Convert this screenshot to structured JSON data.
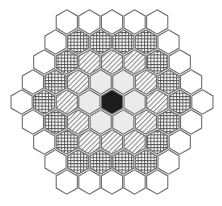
{
  "diagram": {
    "type": "hexagonal-lattice",
    "orientation": "pointy-top",
    "center": {
      "x": 112,
      "y": 102
    },
    "hex_radius": 12.2,
    "col_spacing": 22.6,
    "row_spacing": 20,
    "legend_styles": {
      "W": {
        "name": "white",
        "fill": "#ffffff"
      },
      "C": {
        "name": "crosshatch",
        "fill": "url(#crosshatch)"
      },
      "H": {
        "name": "diagonal-hatch",
        "fill": "url(#diaghatch)"
      },
      "G": {
        "name": "light-gray",
        "fill": "#ebebeb"
      },
      "B": {
        "name": "black",
        "fill": "#1c1c1c"
      }
    },
    "rows": [
      [
        "W",
        "W",
        "W",
        "W",
        "W"
      ],
      [
        "W",
        "C",
        "C",
        "C",
        "C",
        "W"
      ],
      [
        "W",
        "C",
        "H",
        "H",
        "H",
        "C",
        "W"
      ],
      [
        "W",
        "C",
        "H",
        "G",
        "G",
        "H",
        "C",
        "W"
      ],
      [
        "W",
        "C",
        "H",
        "G",
        "B",
        "G",
        "H",
        "C",
        "W"
      ],
      [
        "W",
        "C",
        "H",
        "G",
        "G",
        "H",
        "C",
        "W"
      ],
      [
        "W",
        "C",
        "H",
        "H",
        "H",
        "C",
        "W"
      ],
      [
        "W",
        "C",
        "C",
        "C",
        "C",
        "W"
      ],
      [
        "W",
        "W",
        "W",
        "W",
        "W"
      ]
    ],
    "colors": {
      "stroke": "#6e6e6e",
      "pattern_line": "#555555",
      "hatch_line": "#8a8a8a",
      "background": "#ffffff"
    }
  }
}
